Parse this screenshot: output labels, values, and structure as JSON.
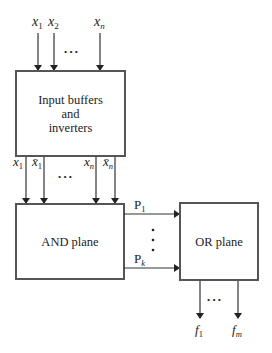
{
  "diagram": {
    "inputs": {
      "labels": [
        {
          "base": "x",
          "sub": "1"
        },
        {
          "base": "x",
          "sub": "2"
        },
        {
          "base": "x",
          "sub": "n"
        }
      ],
      "ellipsis": "• • •"
    },
    "input_block": {
      "line1": "Input buffers",
      "line2": "and",
      "line3": "inverters"
    },
    "literals": {
      "labels": [
        {
          "base": "x",
          "sub": "1",
          "bar": false
        },
        {
          "base": "x̄",
          "sub": "1",
          "bar": true
        },
        {
          "base": "x",
          "sub": "n",
          "bar": false
        },
        {
          "base": "x̄",
          "sub": "n",
          "bar": true
        }
      ],
      "ellipsis": "• • •"
    },
    "and_plane": {
      "label": "AND plane"
    },
    "products": {
      "labels": [
        {
          "base": "P",
          "sub": "1"
        },
        {
          "base": "P",
          "sub": "k"
        }
      ],
      "ellipsis": "⋮"
    },
    "or_plane": {
      "label": "OR plane"
    },
    "outputs": {
      "labels": [
        {
          "base": "f",
          "sub": "1"
        },
        {
          "base": "f",
          "sub": "m"
        }
      ],
      "ellipsis": "• • •"
    },
    "colors": {
      "box_stroke": "#555555",
      "line": "#333333",
      "text": "#222222",
      "background": "#ffffff"
    }
  }
}
